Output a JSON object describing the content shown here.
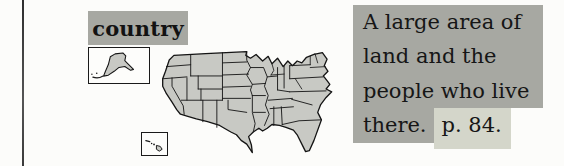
{
  "page": {
    "background": "#fcfcfa",
    "rule_color": "#3e3e3e"
  },
  "entry": {
    "headword": "country",
    "definition": {
      "lines": [
        "A large area of",
        "land and the",
        "people who live",
        "there."
      ],
      "page_ref": "p. 84."
    },
    "colors": {
      "highlight": "#a7a8a2",
      "page_ref_highlight": "#d4d6ca",
      "text": "#161616",
      "map_fill": "#c8c9c4",
      "map_stroke": "#141414"
    },
    "illustration": {
      "name": "usa-map",
      "insets": [
        "alaska-inset",
        "hawaii-inset"
      ]
    }
  }
}
